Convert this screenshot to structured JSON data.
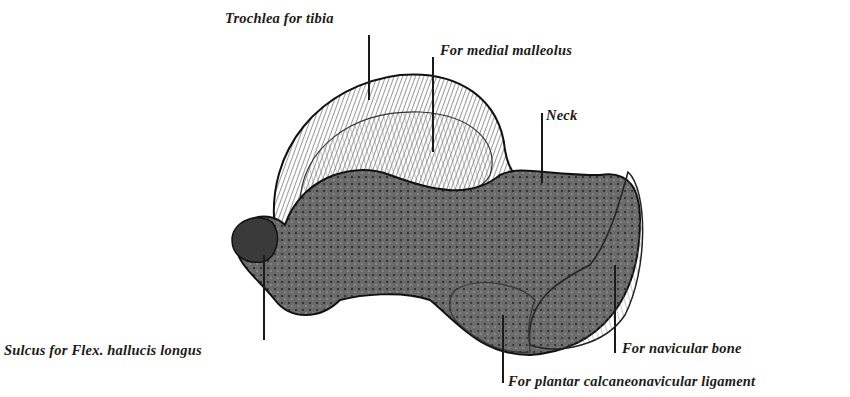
{
  "figure": {
    "colors": {
      "ink": "#1a1a1a",
      "background": "#ffffff"
    }
  },
  "labels": [
    {
      "id": "trochlea",
      "text": "Trochlea for tibia"
    },
    {
      "id": "medial-malleolus",
      "text": "For medial malleolus"
    },
    {
      "id": "neck",
      "text": "Neck"
    },
    {
      "id": "sulcus",
      "text": "Sulcus for Flex. hallucis longus"
    },
    {
      "id": "navicular",
      "text": "For navicular bone"
    },
    {
      "id": "plantar-ligament",
      "text": "For plantar calcaneonavicular ligament"
    }
  ]
}
